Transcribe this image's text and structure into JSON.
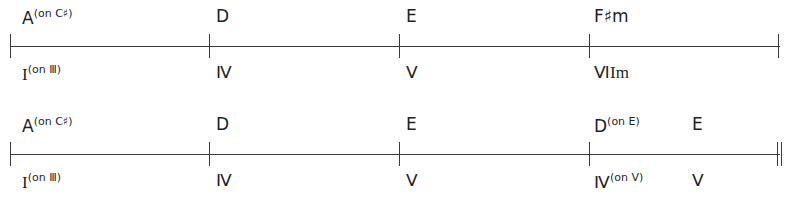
{
  "diagram": {
    "kind": "chord-progression-timeline",
    "systems": [
      {
        "id": "system-1",
        "end_barline": "single",
        "barlines": [
          10,
          209,
          399,
          589,
          778
        ],
        "events": [
          {
            "x": 22,
            "chord": "A",
            "chord_sup": "(on C♯)",
            "numeral": "I",
            "numeral_sup": "(on Ⅲ)"
          },
          {
            "x": 216,
            "chord": "D",
            "chord_sup": "",
            "numeral": "Ⅳ",
            "numeral_sup": ""
          },
          {
            "x": 406,
            "chord": "E",
            "chord_sup": "",
            "numeral": "Ⅴ",
            "numeral_sup": ""
          },
          {
            "x": 594,
            "chord": "F♯m",
            "chord_sup": "",
            "numeral": "ⅥIm",
            "numeral_sup": ""
          }
        ]
      },
      {
        "id": "system-2",
        "end_barline": "double",
        "barlines": [
          10,
          209,
          399,
          589,
          777
        ],
        "events": [
          {
            "x": 22,
            "chord": "A",
            "chord_sup": "(on C♯)",
            "numeral": "I",
            "numeral_sup": "(on Ⅲ)"
          },
          {
            "x": 216,
            "chord": "D",
            "chord_sup": "",
            "numeral": "Ⅳ",
            "numeral_sup": ""
          },
          {
            "x": 406,
            "chord": "E",
            "chord_sup": "",
            "numeral": "Ⅴ",
            "numeral_sup": ""
          },
          {
            "x": 594,
            "chord": "D",
            "chord_sup": "(on E)",
            "numeral": "Ⅳ",
            "numeral_sup": "(on Ⅴ)"
          },
          {
            "x": 692,
            "chord": "E",
            "chord_sup": "",
            "numeral": "Ⅴ",
            "numeral_sup": ""
          }
        ]
      }
    ]
  }
}
